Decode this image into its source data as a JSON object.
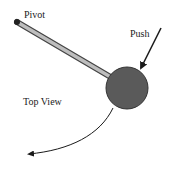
{
  "labels": {
    "pivot": "Pivot",
    "push": "Push",
    "top_view": "Top View"
  },
  "colors": {
    "rod_fill": "#bdbdbd",
    "rod_outline": "#444444",
    "ball_fill": "#5a5a5a",
    "ball_outline": "#333333",
    "arrow": "#1a1a1a",
    "text": "#222222"
  },
  "icons": {
    "pivot": "pivot-point-icon",
    "push_arrow": "push-arrow-icon",
    "motion_arrow": "curved-motion-arrow-icon"
  }
}
